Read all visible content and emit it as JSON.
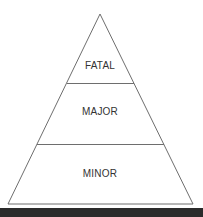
{
  "diagram": {
    "type": "pyramid",
    "levels": [
      {
        "label": "FATAL",
        "position": "top"
      },
      {
        "label": "MAJOR",
        "position": "middle"
      },
      {
        "label": "MINOR",
        "position": "bottom"
      }
    ],
    "colors": {
      "stroke": "#6e6e6e",
      "text": "#333333",
      "fill": "#ffffff",
      "bottom_bar": "#2b2b2b"
    }
  }
}
